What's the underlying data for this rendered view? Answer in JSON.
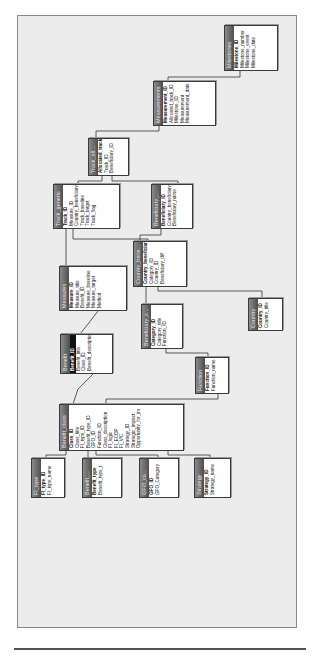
{
  "diagram": {
    "type": "database-relationships",
    "orientation": "rotated-90-ccw",
    "tables": [
      {
        "id": "milestones",
        "title": "Milestones",
        "fields": [
          {
            "name": "Milestone_ID",
            "pk": true
          },
          {
            "name": "Milestone_number"
          },
          {
            "name": "Milestone_event"
          },
          {
            "name": "Milestone_date"
          }
        ]
      },
      {
        "id": "measurements",
        "title": "Measurements",
        "fields": [
          {
            "name": "Measurement_ID",
            "pk": true
          },
          {
            "name": "Allocated_track_ID"
          },
          {
            "name": "Milestone_ID"
          },
          {
            "name": "Measurement"
          },
          {
            "name": "Measurement_date"
          }
        ]
      },
      {
        "id": "track_all",
        "title": "Track_all...",
        "fields": [
          {
            "name": "Allocated_track_",
            "pk": true
          },
          {
            "name": "Track_ID"
          },
          {
            "name": "Beneficiary_ID"
          }
        ]
      },
      {
        "id": "track_generic",
        "title": "Track_generic",
        "fields": [
          {
            "name": "Track_ID",
            "pk": true
          },
          {
            "name": "Measure_ID"
          },
          {
            "name": "Country_beneficiary_"
          },
          {
            "name": "Track_baseline"
          },
          {
            "name": "Track_target"
          },
          {
            "name": "Track_flag"
          }
        ]
      },
      {
        "id": "beneficiary",
        "title": "Beneficiary_...",
        "fields": [
          {
            "name": "Beneficiary_ID",
            "pk": true
          },
          {
            "name": "Country_beneficiary_"
          },
          {
            "name": "Beneficiary_name"
          }
        ]
      },
      {
        "id": "country_bene",
        "title": "Country_bene...",
        "fields": [
          {
            "name": "Country_beneficiary_I",
            "pk": true
          },
          {
            "name": "Category_ID"
          },
          {
            "name": "Country_ID"
          },
          {
            "name": "Beneficiary_diff"
          }
        ]
      },
      {
        "id": "measures",
        "title": "Measures",
        "fields": [
          {
            "name": "Measure_ID",
            "pk": true
          },
          {
            "name": "Measure_title"
          },
          {
            "name": "Benefit_ID"
          },
          {
            "name": "Measure_baseline"
          },
          {
            "name": "Measure_target"
          },
          {
            "name": "Method"
          }
        ]
      },
      {
        "id": "country",
        "title": "Country",
        "fields": [
          {
            "name": "Country_ID",
            "pk": true
          },
          {
            "name": "Country_title"
          }
        ]
      },
      {
        "id": "beneficiary_c",
        "title": "Beneficiary_c...",
        "fields": [
          {
            "name": "Category_ID",
            "pk": true
          },
          {
            "name": "Category_title"
          },
          {
            "name": "Function_ID"
          }
        ]
      },
      {
        "id": "benefit",
        "title": "Benefit",
        "fields": [
          {
            "name": "Benefit_ID",
            "pk": true,
            "selected": true
          },
          {
            "name": "Benefit_title"
          },
          {
            "name": "Class_ID"
          },
          {
            "name": "Benefit_description"
          }
        ]
      },
      {
        "id": "function",
        "title": "Function",
        "fields": [
          {
            "name": "Function_ID",
            "pk": true
          },
          {
            "name": "Function_name"
          }
        ]
      },
      {
        "id": "benefit_class",
        "title": "Benefit_class",
        "fields": [
          {
            "name": "Class_ID",
            "pk": true
          },
          {
            "name": "Class_title"
          },
          {
            "name": "FI_type_ID"
          },
          {
            "name": "Benefit_type_ID"
          },
          {
            "name": "GFO_ID"
          },
          {
            "name": "Function_ID"
          },
          {
            "name": "Class_description"
          },
          {
            "name": "FI_logic"
          },
          {
            "name": "FI_ECOP"
          },
          {
            "name": "FI_VfC"
          },
          {
            "name": "Strategy_ID"
          },
          {
            "name": "Strategic_impact"
          },
          {
            "name": "Opportunity_for_im"
          }
        ]
      },
      {
        "id": "fi_type",
        "title": "FI_type",
        "fields": [
          {
            "name": "FI_type_ID",
            "pk": true
          },
          {
            "name": "FI_type_name"
          }
        ]
      },
      {
        "id": "benefit_type",
        "title": "Benefit_...",
        "fields": [
          {
            "name": "Benefit_type",
            "pk": true
          },
          {
            "name": "Benefit_type_t"
          }
        ]
      },
      {
        "id": "gfo_cat",
        "title": "GFO_ca...",
        "fields": [
          {
            "name": "GFO_ID",
            "pk": true
          },
          {
            "name": "GFO_Category"
          }
        ]
      },
      {
        "id": "strategy",
        "title": "Strategy",
        "fields": [
          {
            "name": "Strategy_ID",
            "pk": true
          },
          {
            "name": "Strategy_name"
          }
        ]
      }
    ],
    "relationships": [
      [
        "milestones",
        "measurements"
      ],
      [
        "measurements",
        "track_all"
      ],
      [
        "track_all",
        "track_generic"
      ],
      [
        "track_all",
        "beneficiary"
      ],
      [
        "track_generic",
        "country_bene"
      ],
      [
        "beneficiary",
        "country_bene"
      ],
      [
        "track_generic",
        "measures"
      ],
      [
        "country_bene",
        "beneficiary_c"
      ],
      [
        "country_bene",
        "country"
      ],
      [
        "measures",
        "benefit"
      ],
      [
        "beneficiary_c",
        "function"
      ],
      [
        "benefit",
        "benefit_class"
      ],
      [
        "function",
        "benefit_class"
      ],
      [
        "benefit_class",
        "fi_type"
      ],
      [
        "benefit_class",
        "benefit_type"
      ],
      [
        "benefit_class",
        "gfo_cat"
      ],
      [
        "benefit_class",
        "strategy"
      ]
    ]
  }
}
